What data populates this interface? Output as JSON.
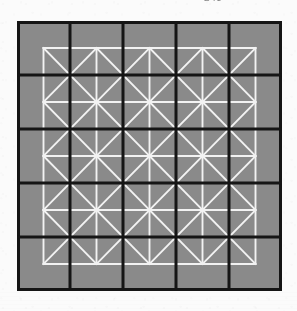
{
  "page": {
    "kind": "scanned-figure",
    "background_color": "#fbfbfb",
    "width": 297,
    "height": 311
  },
  "header": {
    "fragment_text": "— 248 —",
    "note": "cut-off running head at top edge, illegible in scan"
  },
  "figure": {
    "caption": "",
    "bounds": {
      "x": 17,
      "y": 21,
      "width": 265,
      "height": 270
    },
    "fill_color": "#8a8a8a",
    "black_line_color": "#151515",
    "white_line_color": "#f2f2f2",
    "black_grid": {
      "label": "black square lattice",
      "rows": 5,
      "cols": 5,
      "line_width": 3,
      "cell_width": 53,
      "cell_height": 54,
      "draw_border": true,
      "x_lines": [
        0,
        53,
        106,
        159,
        212,
        265
      ],
      "y_lines": [
        0,
        54,
        108,
        162,
        216,
        270
      ]
    },
    "white_grid": {
      "label": "white square lattice with both diagonals",
      "rows": 4,
      "cols": 4,
      "line_width": 1.9,
      "offset_x": 26.5,
      "offset_y": 27,
      "cell_width": 53,
      "cell_height": 54,
      "draw_border": true,
      "draw_diagonals": true,
      "x_lines": [
        26.5,
        79.5,
        132.5,
        185.5,
        238.5
      ],
      "y_lines": [
        27,
        81,
        135,
        189,
        243
      ]
    }
  }
}
